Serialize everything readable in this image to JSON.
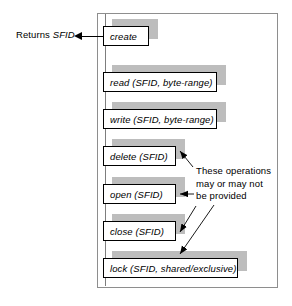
{
  "figure": {
    "frame_color": "#8e8e8e",
    "shadow_color": "#bdbdbd",
    "box_border_color": "#000000",
    "box_fill_color": "#ffffff"
  },
  "callouts": {
    "returns_prefix": "Returns ",
    "returns_value": "SFID",
    "annotation_line1": "These operations",
    "annotation_line2": "may or may not",
    "annotation_line3": "be provided"
  },
  "operations": [
    {
      "id": "create",
      "label": "create"
    },
    {
      "id": "read",
      "label": "read (SFID, byte-range)"
    },
    {
      "id": "write",
      "label": "write (SFID, byte-range)"
    },
    {
      "id": "delete",
      "label": "delete (SFID)"
    },
    {
      "id": "open",
      "label": "open (SFID)"
    },
    {
      "id": "close",
      "label": "close (SFID)"
    },
    {
      "id": "lock",
      "label": "lock (SFID, shared/exclusive)"
    }
  ]
}
